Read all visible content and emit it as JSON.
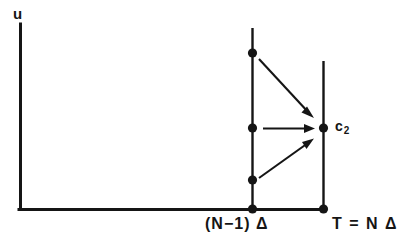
{
  "figure": {
    "type": "diagram",
    "background_color": "#ffffff",
    "ink_color": "#151515"
  },
  "axes": {
    "y_axis_label": "u",
    "origin": {
      "x": 20,
      "y": 209
    },
    "y_axis_top": {
      "x": 20,
      "y": 24
    },
    "x_axis_end": {
      "x": 323,
      "y": 209
    }
  },
  "ticks": [
    {
      "name": "left-tick",
      "label": "(N−1) Δ",
      "x": 252
    },
    {
      "name": "right-tick",
      "label": "T = N Δ",
      "x": 323
    }
  ],
  "vertical_lines": [
    {
      "name": "line-n-minus-1",
      "x": 252,
      "y_top": 28,
      "y_bottom": 209
    },
    {
      "name": "line-n",
      "x": 323,
      "y_top": 61,
      "y_bottom": 209
    }
  ],
  "points": [
    {
      "name": "point-left-top",
      "x": 252,
      "y": 53
    },
    {
      "name": "point-left-middle",
      "x": 252,
      "y": 128
    },
    {
      "name": "point-left-lower",
      "x": 252,
      "y": 180
    },
    {
      "name": "point-left-axis",
      "x": 252,
      "y": 209
    },
    {
      "name": "point-target-c2",
      "x": 323,
      "y": 128,
      "label": "c",
      "sublabel": "2"
    },
    {
      "name": "point-right-axis",
      "x": 323,
      "y": 209
    }
  ],
  "arrows": [
    {
      "name": "arrow-from-top",
      "x1": 259,
      "y1": 59,
      "x2": 312,
      "y2": 116
    },
    {
      "name": "arrow-from-middle",
      "x1": 263,
      "y1": 128,
      "x2": 313,
      "y2": 128
    },
    {
      "name": "arrow-from-lower",
      "x1": 259,
      "y1": 178,
      "x2": 312,
      "y2": 140
    }
  ],
  "target_label": {
    "text": "c",
    "subscript": "2"
  }
}
